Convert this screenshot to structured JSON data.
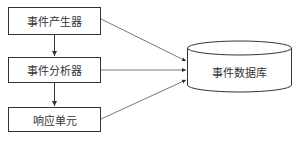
{
  "diagram": {
    "nodes": [
      {
        "id": "generator",
        "label": "事件产生器",
        "shape": "rect"
      },
      {
        "id": "analyzer",
        "label": "事件分析器",
        "shape": "rect"
      },
      {
        "id": "response",
        "label": "响应单元",
        "shape": "rect"
      },
      {
        "id": "database",
        "label": "事件数据库",
        "shape": "cylinder"
      }
    ],
    "edges": [
      {
        "from": "generator",
        "to": "analyzer"
      },
      {
        "from": "analyzer",
        "to": "response"
      },
      {
        "from": "generator",
        "to": "database"
      },
      {
        "from": "analyzer",
        "to": "database"
      },
      {
        "from": "response",
        "to": "database"
      }
    ],
    "colors": {
      "stroke": "#333333",
      "background": "#ffffff"
    }
  }
}
